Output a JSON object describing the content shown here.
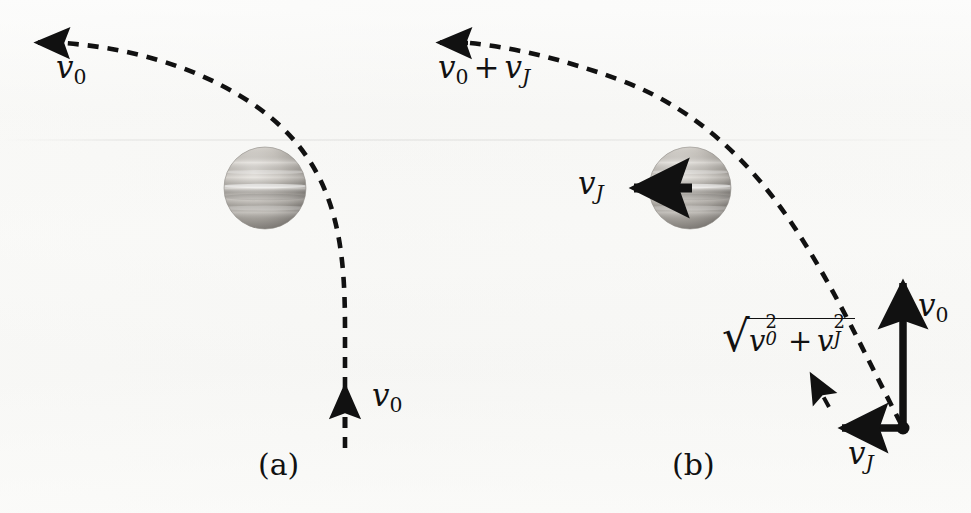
{
  "figure": {
    "background_color": "#f7f7f5",
    "ink_color": "#111111",
    "width": 971,
    "height": 513
  },
  "panels": [
    {
      "id": "a",
      "label": "(a)",
      "label_x": 258,
      "label_y": 452,
      "description": "Jupiter frame: probe approaches with speed v0 and leaves with speed v0",
      "planet": {
        "name": "jupiter",
        "cx": 265,
        "cy": 188,
        "r": 41
      },
      "labels": [
        {
          "name": "incoming-speed-label",
          "text": "v0",
          "base": "v",
          "subscript": "0",
          "subscript_style": "upright",
          "x": 58,
          "y": 56,
          "font_size": 30
        },
        {
          "name": "outgoing-speed-label",
          "text": "v0",
          "base": "v",
          "subscript": "0",
          "subscript_style": "upright",
          "x": 372,
          "y": 382,
          "font_size": 30
        }
      ],
      "arrows": [
        {
          "name": "incoming-velocity-arrow",
          "direction": "left",
          "style": "dashed-path-head"
        },
        {
          "name": "outgoing-velocity-arrow",
          "direction": "up",
          "style": "dashed-path-head"
        }
      ]
    },
    {
      "id": "b",
      "label": "(b)",
      "label_x": 672,
      "label_y": 452,
      "description": "Sun frame: probe approaches with v0 + vJ and leaves with sqrt(v0^2 + vJ^2)",
      "planet": {
        "name": "jupiter",
        "cx": 690,
        "cy": 188,
        "r": 41
      },
      "labels": [
        {
          "name": "incoming-speed-label",
          "text": "v0 + vJ",
          "parts": [
            {
              "base": "v",
              "subscript": "0",
              "subscript_style": "upright"
            },
            {
              "operator": "+"
            },
            {
              "base": "v",
              "subscript": "J",
              "subscript_style": "italic"
            }
          ],
          "x": 440,
          "y": 56,
          "font_size": 30
        },
        {
          "name": "jupiter-velocity-label",
          "text": "vJ",
          "base": "v",
          "subscript": "J",
          "subscript_style": "italic",
          "x": 578,
          "y": 170,
          "font_size": 30
        },
        {
          "name": "resultant-speed-label",
          "text": "sqrt(v0^2 + vJ^2)",
          "latex": "\\sqrt{v_0^2 + v_J^2}",
          "x": 722,
          "y": 322,
          "font_size": 28
        },
        {
          "name": "vector-v0-label",
          "text": "v0",
          "base": "v",
          "subscript": "0",
          "subscript_style": "upright",
          "x": 918,
          "y": 292,
          "font_size": 30
        },
        {
          "name": "vector-vJ-label",
          "text": "vJ",
          "base": "v",
          "subscript": "J",
          "subscript_style": "italic",
          "x": 848,
          "y": 440,
          "font_size": 30
        }
      ],
      "arrows": [
        {
          "name": "incoming-velocity-arrow",
          "direction": "left",
          "style": "dashed-path-head"
        },
        {
          "name": "jupiter-velocity-arrow",
          "direction": "left",
          "style": "solid-thick"
        },
        {
          "name": "outgoing-velocity-arrow",
          "direction": "up-left-diagonal",
          "style": "dashed-path-head"
        },
        {
          "name": "vector-v0-arrow",
          "direction": "up",
          "style": "solid-thick"
        },
        {
          "name": "vector-vJ-arrow",
          "direction": "left",
          "style": "solid-thick"
        }
      ],
      "vector_origin": {
        "x": 903,
        "y": 428,
        "dot_radius": 6
      }
    }
  ],
  "geometry": {
    "trajectory_a": "M 300 448 L 300 300 C 300 190 290 120 140 64 L 40 43",
    "trajectory_b": "M 900 425 C 840 340 800 240 720 150 C 660 90 570 56 440 43",
    "dash_pattern": "11 9",
    "stroke_width": 4.5
  },
  "physics": {
    "planet_name": "Jupiter",
    "frame_a": "Jupiter rest frame",
    "frame_b": "Solar (Sun) frame",
    "incoming_speed_a": "v0",
    "outgoing_speed_a": "v0",
    "incoming_speed_b": "v0 + vJ",
    "outgoing_speed_b": "sqrt(v0^2 + vJ^2)",
    "planet_speed": "vJ"
  }
}
